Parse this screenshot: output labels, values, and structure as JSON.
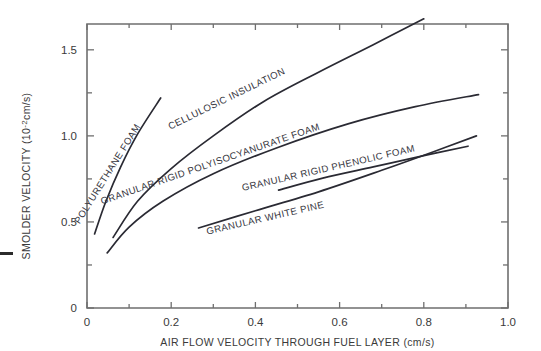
{
  "chart_data": {
    "type": "line",
    "title": "",
    "xlabel": "AIR FLOW VELOCITY THROUGH FUEL LAYER (cm/s)",
    "ylabel": "SMOLDER VELOCITY (10-2cm/s)",
    "ylabel_prefix": "SMOLDER VELOCITY (10",
    "ylabel_exponent": "-2",
    "ylabel_suffix": "cm/s)",
    "xlim": [
      0,
      1.0
    ],
    "ylim": [
      0,
      1.65
    ],
    "grid": false,
    "legend": "inline-curve-labels",
    "xticks": [
      0,
      0.2,
      0.4,
      0.6,
      0.8,
      1.0
    ],
    "xticklabels": [
      "0",
      "0.2",
      "0.4",
      "0.6",
      "0.8",
      "1.0"
    ],
    "xminorticks": [
      0.1,
      0.3,
      0.5,
      0.7,
      0.9
    ],
    "yticks": [
      0,
      0.5,
      1.0,
      1.5
    ],
    "yticklabels": [
      "0",
      "0.5",
      "1.0",
      "1.5"
    ],
    "yminorticks": [
      0.25,
      0.75,
      1.25
    ],
    "series": [
      {
        "name": "POLYURETHANE FOAM",
        "label": "POLYURETHANE FOAM",
        "label_x": 0.055,
        "label_y": 0.77,
        "label_rotation": -58,
        "points": [
          [
            0.018,
            0.43
          ],
          [
            0.045,
            0.62
          ],
          [
            0.08,
            0.82
          ],
          [
            0.12,
            1.01
          ],
          [
            0.175,
            1.22
          ]
        ]
      },
      {
        "name": "CELLULOSIC INSULATION",
        "label": "CELLULOSIC INSULATION",
        "label_x": 0.335,
        "label_y": 1.2,
        "label_rotation": -26,
        "points": [
          [
            0.062,
            0.41
          ],
          [
            0.12,
            0.62
          ],
          [
            0.2,
            0.81
          ],
          [
            0.3,
            1.0
          ],
          [
            0.42,
            1.2
          ],
          [
            0.55,
            1.37
          ],
          [
            0.68,
            1.53
          ],
          [
            0.8,
            1.68
          ]
        ]
      },
      {
        "name": "GRANULAR RIGID POLYISOCYANURATE FOAM",
        "label": "GRANULAR RIGID POLYISOCYANURATE FOAM",
        "label_x": 0.295,
        "label_y": 0.82,
        "label_rotation": -19,
        "points": [
          [
            0.048,
            0.32
          ],
          [
            0.1,
            0.47
          ],
          [
            0.18,
            0.62
          ],
          [
            0.3,
            0.78
          ],
          [
            0.45,
            0.93
          ],
          [
            0.62,
            1.07
          ],
          [
            0.78,
            1.17
          ],
          [
            0.93,
            1.24
          ]
        ]
      },
      {
        "name": "GRANULAR RIGID PHENOLIC FOAM",
        "label": "GRANULAR RIGID PHENOLIC FOAM",
        "label_x": 0.575,
        "label_y": 0.795,
        "label_rotation": -13,
        "points": [
          [
            0.455,
            0.685
          ],
          [
            0.56,
            0.755
          ],
          [
            0.68,
            0.82
          ],
          [
            0.8,
            0.885
          ],
          [
            0.905,
            0.94
          ]
        ]
      },
      {
        "name": "GRANULAR WHITE PINE",
        "label": "GRANULAR WHITE PINE",
        "label_x": 0.425,
        "label_y": 0.505,
        "label_rotation": -13,
        "points": [
          [
            0.265,
            0.465
          ],
          [
            0.4,
            0.565
          ],
          [
            0.55,
            0.675
          ],
          [
            0.7,
            0.8
          ],
          [
            0.82,
            0.905
          ],
          [
            0.925,
            1.0
          ]
        ]
      }
    ]
  },
  "colors": {
    "curve": "#2a2a33",
    "axis": "#6f6f6f",
    "text": "#3a3a3a",
    "background": "#ffffff"
  }
}
